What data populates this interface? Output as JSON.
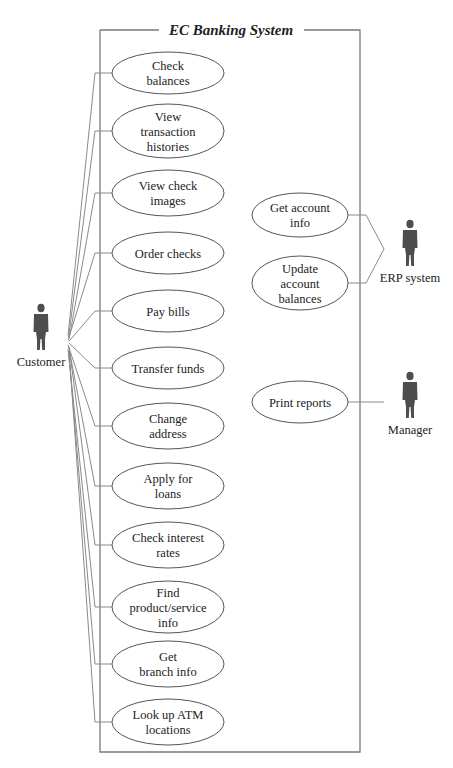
{
  "system": {
    "title": "EC Banking System"
  },
  "actors": [
    {
      "id": "customer",
      "label": "Customer",
      "icon": "person-icon"
    },
    {
      "id": "erp",
      "label": "ERP system",
      "icon": "person-icon"
    },
    {
      "id": "manager",
      "label": "Manager",
      "icon": "person-icon"
    }
  ],
  "customer_use_cases": [
    {
      "lines": [
        "Check",
        "balances"
      ]
    },
    {
      "lines": [
        "View",
        "transaction",
        "histories"
      ]
    },
    {
      "lines": [
        "View check",
        "images"
      ]
    },
    {
      "lines": [
        "Order checks"
      ]
    },
    {
      "lines": [
        "Pay bills"
      ]
    },
    {
      "lines": [
        "Transfer funds"
      ]
    },
    {
      "lines": [
        "Change",
        "address"
      ]
    },
    {
      "lines": [
        "Apply for",
        "loans"
      ]
    },
    {
      "lines": [
        "Check interest",
        "rates"
      ]
    },
    {
      "lines": [
        "Find",
        "product/service",
        "info"
      ]
    },
    {
      "lines": [
        "Get",
        "branch info"
      ]
    },
    {
      "lines": [
        "Look up ATM",
        "locations"
      ]
    }
  ],
  "erp_use_cases": [
    {
      "lines": [
        "Get account",
        "info"
      ]
    },
    {
      "lines": [
        "Update",
        "account",
        "balances"
      ]
    }
  ],
  "manager_use_cases": [
    {
      "lines": [
        "Print reports"
      ]
    }
  ],
  "colors": {
    "line": "#8a8a8a",
    "actor": "#4e4e4e",
    "ellipse_stroke": "#555555"
  }
}
